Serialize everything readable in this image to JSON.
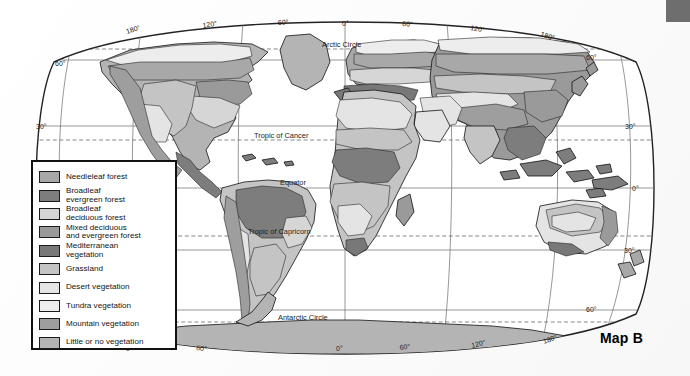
{
  "figure": {
    "caption": "Map B"
  },
  "legend": {
    "items": [
      {
        "label": "Needleleaf forest",
        "color": "#a8a8a8"
      },
      {
        "label": "Broadleaf\nevergreen forest",
        "color": "#7d7d7d"
      },
      {
        "label": "Broadleaf\ndeciduous forest",
        "color": "#d6d6d6"
      },
      {
        "label": "Mixed deciduous\nand evergreen forest",
        "color": "#9a9a9a"
      },
      {
        "label": "Mediterranean\nvegetation",
        "color": "#787878"
      },
      {
        "label": "Grassland",
        "color": "#c4c4c4"
      },
      {
        "label": "Desert vegetation",
        "color": "#e4e4e4"
      },
      {
        "label": "Tundra vegetation",
        "color": "#ededed"
      },
      {
        "label": "Mountain vegetation",
        "color": "#9e9e9e"
      },
      {
        "label": "Little or no vegetation",
        "color": "#b4b4b4"
      }
    ]
  },
  "map": {
    "reference_lines": [
      {
        "name": "arctic-circle",
        "label": "Arctic Circle"
      },
      {
        "name": "tropic-of-cancer",
        "label": "Tropic of Cancer"
      },
      {
        "name": "equator",
        "label": "Equator"
      },
      {
        "name": "tropic-of-capricorn",
        "label": "Tropic of Capricorn"
      },
      {
        "name": "antarctic-circle",
        "label": "Antarctic Circle"
      }
    ],
    "longitude_labels_top": [
      "180°",
      "120°",
      "60°",
      "0°",
      "60°",
      "120°",
      "180°"
    ],
    "longitude_labels_bottom": [
      "120°",
      "60°",
      "0°",
      "60°",
      "120°",
      "180°"
    ],
    "latitude_labels_left": [
      "60°",
      "30°"
    ],
    "latitude_labels_right": [
      "60°",
      "30°",
      "0°",
      "30°",
      "60°"
    ],
    "projection": "oval / Robinson-like world projection"
  },
  "colors": {
    "outline": "#111111",
    "graticule": "#6b6b6b",
    "ocean": "#ffffff",
    "corner_block": "#6e6e6e"
  }
}
